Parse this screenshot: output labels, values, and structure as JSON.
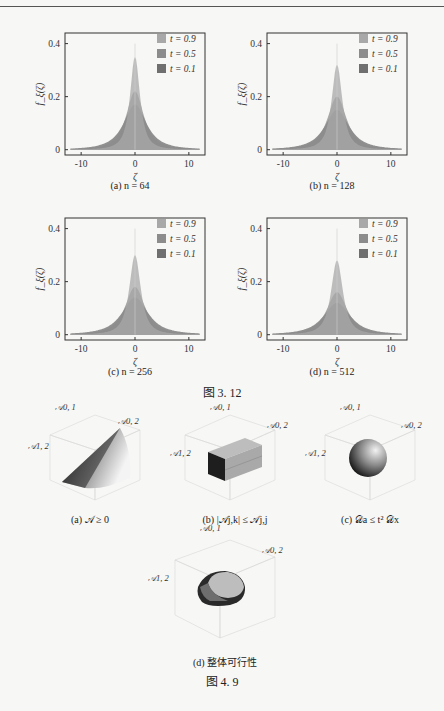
{
  "figure_3_12": {
    "title": "图 3. 12",
    "panels": [
      {
        "caption": "(a) n = 64",
        "n": 64
      },
      {
        "caption": "(b) n = 128",
        "n": 128
      },
      {
        "caption": "(c) n = 256",
        "n": 256
      },
      {
        "caption": "(d) n = 512",
        "n": 512
      }
    ],
    "ylabel": "f_ξ(ζ)",
    "xlabel": "ζ",
    "xticks": [
      "-10",
      "0",
      "10"
    ],
    "yticks": [
      "0",
      "0.2",
      "0.4"
    ],
    "legend": [
      "t = 0.9",
      "t = 0.5",
      "t = 0.1"
    ]
  },
  "figure_4_9": {
    "title": "图 4. 9",
    "panels": [
      {
        "caption": "(a) 𝒜 ≥ 0",
        "shape": "cone"
      },
      {
        "caption": "(b) |𝒜j,k| ≤ 𝒜j,j",
        "shape": "box"
      },
      {
        "caption": "(c) 𝒟a ≤ t² 𝒟x",
        "shape": "sphere"
      },
      {
        "caption": "(d) 整体可行性",
        "shape": "intersection"
      }
    ],
    "axis_labels": {
      "a01": "𝒜0, 1",
      "a02": "𝒜0, 2",
      "a12": "𝒜1, 2"
    }
  },
  "chart_data": [
    {
      "type": "area",
      "title": "(a) n = 64",
      "xlabel": "ζ",
      "ylabel": "f_ξ(ζ)",
      "xlim": [
        -13,
        13
      ],
      "ylim": [
        -0.02,
        0.44
      ],
      "xticks": [
        -10,
        0,
        10
      ],
      "yticks": [
        0,
        0.2,
        0.4
      ],
      "legend_position": "upper right",
      "series": [
        {
          "name": "t = 0.9",
          "peak": 0.35,
          "width": 1.3
        },
        {
          "name": "t = 0.5",
          "peak": 0.22,
          "width": 2.3
        },
        {
          "name": "t = 0.1",
          "peak": 0.17,
          "width": 3.0
        }
      ]
    },
    {
      "type": "area",
      "title": "(b) n = 128",
      "xlabel": "ζ",
      "ylabel": "f_ξ(ζ)",
      "xlim": [
        -13,
        13
      ],
      "ylim": [
        -0.02,
        0.44
      ],
      "xticks": [
        -10,
        0,
        10
      ],
      "yticks": [
        0,
        0.2,
        0.4
      ],
      "legend_position": "upper right",
      "series": [
        {
          "name": "t = 0.9",
          "peak": 0.32,
          "width": 1.4
        },
        {
          "name": "t = 0.5",
          "peak": 0.2,
          "width": 2.5
        },
        {
          "name": "t = 0.1",
          "peak": 0.15,
          "width": 3.2
        }
      ]
    },
    {
      "type": "area",
      "title": "(c) n = 256",
      "xlabel": "ζ",
      "ylabel": "f_ξ(ζ)",
      "xlim": [
        -13,
        13
      ],
      "ylim": [
        -0.02,
        0.44
      ],
      "xticks": [
        -10,
        0,
        10
      ],
      "yticks": [
        0,
        0.2,
        0.4
      ],
      "legend_position": "upper right",
      "series": [
        {
          "name": "t = 0.9",
          "peak": 0.3,
          "width": 1.5
        },
        {
          "name": "t = 0.5",
          "peak": 0.18,
          "width": 2.6
        },
        {
          "name": "t = 0.1",
          "peak": 0.14,
          "width": 3.4
        }
      ]
    },
    {
      "type": "area",
      "title": "(d) n = 512",
      "xlabel": "ζ",
      "ylabel": "f_ξ(ζ)",
      "xlim": [
        -13,
        13
      ],
      "ylim": [
        -0.02,
        0.44
      ],
      "xticks": [
        -10,
        0,
        10
      ],
      "yticks": [
        0,
        0.2,
        0.4
      ],
      "legend_position": "upper right",
      "series": [
        {
          "name": "t = 0.9",
          "peak": 0.28,
          "width": 1.55
        },
        {
          "name": "t = 0.5",
          "peak": 0.16,
          "width": 2.7
        },
        {
          "name": "t = 0.1",
          "peak": 0.12,
          "width": 3.5
        }
      ]
    }
  ]
}
